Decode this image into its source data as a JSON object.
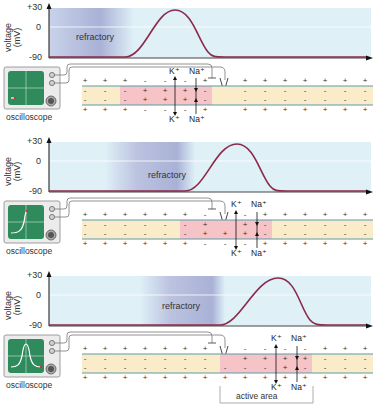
{
  "axis": {
    "ylabel_line1": "voltage",
    "ylabel_line2": "(mV)",
    "ticks": [
      "+30",
      "0",
      "-90"
    ]
  },
  "labels": {
    "refractory": "refractory",
    "oscilloscope": "oscilloscope",
    "active_area": "active area",
    "k_ion": "K⁺",
    "na_ion": "Na⁺"
  },
  "colors": {
    "plot_bg": "#dff0f7",
    "refractory_shade": "#a9b1d6",
    "curve": "#8b2a4a",
    "membrane_line": "#5a9bb0",
    "inner_band": "#fbecc9",
    "active_band": "#f6c3c6",
    "screen_green": "#2f8a5c"
  },
  "panels": [
    {
      "name": "panel-1",
      "refractory_x": [
        55,
        130
      ],
      "peak_x": 175,
      "active_x": [
        120,
        212
      ],
      "electrode_x": 222
    },
    {
      "name": "panel-2",
      "refractory_x": [
        110,
        185
      ],
      "peak_x": 237,
      "active_x": [
        180,
        272
      ],
      "electrode_x": 222
    },
    {
      "name": "panel-3",
      "refractory_x": [
        150,
        225
      ],
      "peak_x": 278,
      "active_x": [
        220,
        312
      ],
      "electrode_x": 222
    }
  ]
}
